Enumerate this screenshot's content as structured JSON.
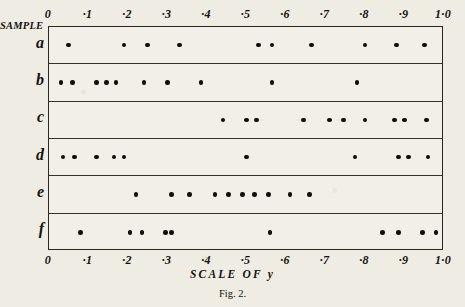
{
  "figure": {
    "caption": "Fig. 2.",
    "sample_heading": "SAMPLE",
    "x_axis_title": "SCALE  OF  y",
    "background_color": "#efece4",
    "ink_color": "#100e0c"
  },
  "chart_data": {
    "type": "scatter",
    "title": "Fig. 2.",
    "xlabel": "SCALE OF y",
    "ylabel": "SAMPLE",
    "xlim": [
      0,
      1.0
    ],
    "grid": false,
    "legend": "none",
    "tick_labels": [
      "0",
      "·1",
      "·2",
      "·3",
      "·4",
      "·5",
      "·6",
      "·7",
      "·8",
      "·9",
      "1·0"
    ],
    "tick_values": [
      0,
      0.1,
      0.2,
      0.3,
      0.4,
      0.5,
      0.6,
      0.7,
      0.8,
      0.9,
      1.0
    ],
    "series": [
      {
        "name": "a",
        "values": [
          0.05,
          0.19,
          0.25,
          0.33,
          0.53,
          0.565,
          0.665,
          0.8,
          0.88,
          0.95
        ]
      },
      {
        "name": "b",
        "values": [
          0.03,
          0.06,
          0.12,
          0.145,
          0.17,
          0.24,
          0.3,
          0.385,
          0.565,
          0.78
        ]
      },
      {
        "name": "c",
        "values": [
          0.44,
          0.5,
          0.525,
          0.645,
          0.71,
          0.745,
          0.8,
          0.875,
          0.9,
          0.955
        ]
      },
      {
        "name": "d",
        "values": [
          0.035,
          0.065,
          0.12,
          0.165,
          0.19,
          0.5,
          0.775,
          0.885,
          0.91,
          0.96
        ]
      },
      {
        "name": "e",
        "values": [
          0.22,
          0.31,
          0.355,
          0.42,
          0.455,
          0.49,
          0.52,
          0.555,
          0.61,
          0.66
        ]
      },
      {
        "name": "f",
        "values": [
          0.08,
          0.205,
          0.235,
          0.295,
          0.31,
          0.56,
          0.845,
          0.885,
          0.945,
          0.98
        ]
      }
    ]
  }
}
